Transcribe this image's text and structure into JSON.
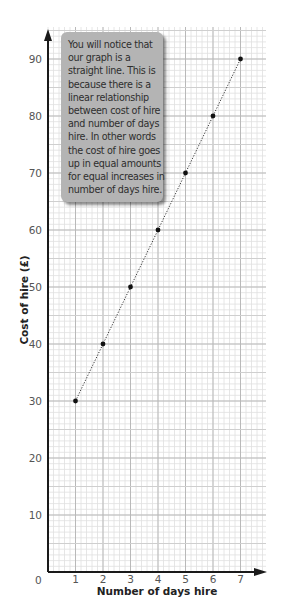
{
  "chart_data": {
    "type": "line",
    "title": "",
    "xlabel": "Number of days hire",
    "ylabel": "Cost of hire (£)",
    "x": [
      1,
      2,
      3,
      4,
      5,
      6,
      7
    ],
    "series": [
      {
        "name": "Cost of hire",
        "values": [
          30,
          40,
          50,
          60,
          70,
          80,
          90
        ],
        "style": "dotted line with point markers"
      }
    ],
    "x_ticks": [
      "0",
      "1",
      "2",
      "3",
      "4",
      "5",
      "6",
      "7"
    ],
    "y_ticks": [
      "10",
      "20",
      "30",
      "40",
      "50",
      "60",
      "70",
      "80",
      "90"
    ],
    "xlim": [
      0,
      7.9
    ],
    "ylim": [
      0,
      95
    ],
    "grid": true,
    "legend": null,
    "annotations": [
      {
        "type": "callout",
        "lines": [
          "You will notice that",
          "our graph is a",
          "straight line. This is",
          "because there is a",
          "linear relationship",
          "between cost of hire",
          "and number of days",
          "hire. In other words",
          "the cost of hire goes",
          "up in equal amounts",
          "for equal increases in",
          "number of days hire."
        ]
      }
    ]
  },
  "colors": {
    "grid_minor": "#e0e0e0",
    "grid_major": "#b9b9b9",
    "axis": "#1a1a1a",
    "points": "#111111",
    "callout_bg": "#b4b4b4",
    "callout_text": "#2e2e2e"
  },
  "labels": {
    "origin": "0",
    "x_axis_title": "Number of days hire",
    "y_axis_title": "Cost of hire (£)"
  }
}
